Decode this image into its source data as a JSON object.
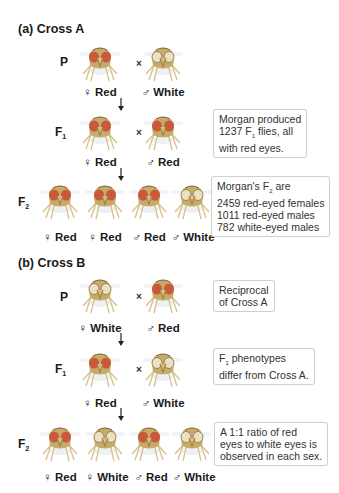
{
  "colors": {
    "red_eye": "#c9593a",
    "white_eye": "#e8dcc0",
    "body": "#c7ab6a",
    "leg": "#d9c08a",
    "note_border": "#cfcfcf"
  },
  "symbols": {
    "female": "♀",
    "male": "♂",
    "cross": "×"
  },
  "cross_a": {
    "title": "(a)  Cross A",
    "p": {
      "gen": "P",
      "flies": [
        {
          "sex": "female",
          "eye": "red",
          "label": "♀ Red"
        },
        {
          "sex": "male",
          "eye": "white",
          "label": "♂ White"
        }
      ]
    },
    "f1": {
      "gen": "F",
      "gen_sub": "1",
      "flies": [
        {
          "sex": "female",
          "eye": "red",
          "label": "♀ Red"
        },
        {
          "sex": "male",
          "eye": "red",
          "label": "♂ Red"
        }
      ],
      "note": [
        "Morgan produced",
        "1237 F",
        "1",
        " flies, all",
        "with red eyes."
      ]
    },
    "f2": {
      "gen": "F",
      "gen_sub": "2",
      "flies": [
        {
          "sex": "female",
          "eye": "red",
          "label": "♀ Red"
        },
        {
          "sex": "female",
          "eye": "red",
          "label": "♀ Red"
        },
        {
          "sex": "male",
          "eye": "red",
          "label": "♂ Red"
        },
        {
          "sex": "male",
          "eye": "white",
          "label": "♂ White"
        }
      ],
      "note": [
        "Morgan's F",
        "2",
        " are",
        "2459 red-eyed females",
        "1011 red-eyed males",
        "782 white-eyed males"
      ]
    }
  },
  "cross_b": {
    "title": "(b)  Cross B",
    "p": {
      "gen": "P",
      "flies": [
        {
          "sex": "female",
          "eye": "white",
          "label": "♀ White"
        },
        {
          "sex": "male",
          "eye": "red",
          "label": "♂ Red"
        }
      ],
      "note": [
        "Reciprocal",
        "of Cross A"
      ]
    },
    "f1": {
      "gen": "F",
      "gen_sub": "1",
      "flies": [
        {
          "sex": "female",
          "eye": "red",
          "label": "♀ Red"
        },
        {
          "sex": "male",
          "eye": "white",
          "label": "♂ White"
        }
      ],
      "note": [
        "F",
        "1",
        " phenotypes",
        "differ from Cross A."
      ]
    },
    "f2": {
      "gen": "F",
      "gen_sub": "2",
      "flies": [
        {
          "sex": "female",
          "eye": "red",
          "label": "♀ Red"
        },
        {
          "sex": "female",
          "eye": "white",
          "label": "♀ White"
        },
        {
          "sex": "male",
          "eye": "red",
          "label": "♂ Red"
        },
        {
          "sex": "male",
          "eye": "white",
          "label": "♂ White"
        }
      ],
      "note": [
        "A 1:1 ratio of red",
        "eyes to white eyes is",
        "observed in each sex."
      ]
    }
  }
}
